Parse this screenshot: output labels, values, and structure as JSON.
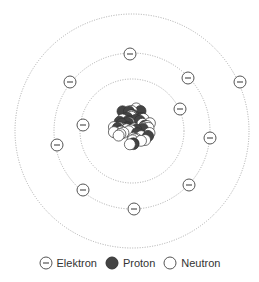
{
  "diagram": {
    "title": "",
    "center": [
      132,
      131
    ],
    "orbits": [
      {
        "name": "inner",
        "radius": 52
      },
      {
        "name": "middle",
        "radius": 78
      },
      {
        "name": "outer",
        "radius": 117
      }
    ],
    "electrons": [
      {
        "x": 83,
        "y": 125
      },
      {
        "x": 180,
        "y": 109
      },
      {
        "x": 210,
        "y": 138
      },
      {
        "x": 130,
        "y": 54
      },
      {
        "x": 70,
        "y": 82
      },
      {
        "x": 188,
        "y": 78
      },
      {
        "x": 57,
        "y": 145
      },
      {
        "x": 83,
        "y": 190
      },
      {
        "x": 189,
        "y": 185
      },
      {
        "x": 134,
        "y": 209
      },
      {
        "x": 240,
        "y": 82
      }
    ],
    "electron_symbol": "−",
    "colors": {
      "proton": "#444444",
      "neutron": "#ffffff",
      "orbit": "#aaaaaa",
      "outline": "#555555"
    }
  },
  "legend": {
    "items": [
      {
        "type": "electron",
        "label": "Elektron"
      },
      {
        "type": "proton",
        "label": "Proton"
      },
      {
        "type": "neutron",
        "label": "Neutron"
      }
    ]
  }
}
